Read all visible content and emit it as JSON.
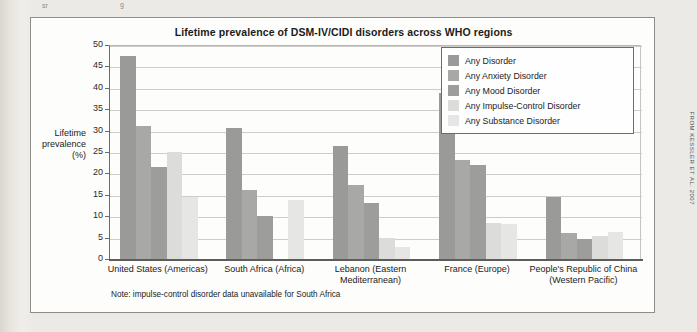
{
  "page": {
    "attribution": "FROM KESSLER ET AL. 2007",
    "top_specks": [
      "sr",
      "g"
    ]
  },
  "chart_data": {
    "type": "bar",
    "title": "Lifetime prevalence of DSM-IV/CIDI disorders across WHO regions",
    "xlabel": "",
    "ylabel": "Lifetime prevalence (%)",
    "ylabel_lines": [
      "Lifetime",
      "prevalence",
      "(%)"
    ],
    "ylim": [
      0,
      50
    ],
    "yticks": [
      0,
      5,
      10,
      15,
      20,
      25,
      30,
      35,
      40,
      45,
      50
    ],
    "ytick_labels": [
      "0",
      "5",
      "10",
      "15",
      "20",
      "25",
      "30",
      "35",
      "40",
      "45",
      "50"
    ],
    "grid": true,
    "legend_position": "top-right",
    "categories": [
      "United States (Americas)",
      "South Africa (Africa)",
      "Lebanon (Eastern Mediterranean)",
      "France (Europe)",
      "People's Republic of China (Western Pacific)"
    ],
    "category_lines": [
      [
        "United States (Americas)"
      ],
      [
        "South Africa (Africa)"
      ],
      [
        "Lebanon (Eastern",
        "Mediterranean)"
      ],
      [
        "France (Europe)"
      ],
      [
        "People's Republic of China",
        "(Western Pacific)"
      ]
    ],
    "series": [
      {
        "name": "Any Disorder",
        "color": "#9a9a99",
        "values": [
          47.4,
          30.5,
          26.3,
          38.7,
          14.4
        ]
      },
      {
        "name": "Any Anxiety Disorder",
        "color": "#a8a8a6",
        "values": [
          31.0,
          16.1,
          17.4,
          23.2,
          6.0
        ]
      },
      {
        "name": "Any Mood Disorder",
        "color": "#9d9d9b",
        "values": [
          21.4,
          10.1,
          13.2,
          21.9,
          4.7
        ]
      },
      {
        "name": "Any Impulse-Control Disorder",
        "color": "#dcdcda",
        "values": [
          25.1,
          null,
          4.9,
          8.5,
          5.4
        ]
      },
      {
        "name": "Any Substance Disorder",
        "color": "#e6e6e4",
        "values": [
          14.6,
          13.7,
          2.9,
          8.2,
          6.2
        ]
      }
    ],
    "note": "Note: impulse-control disorder data unavailable for South Africa"
  }
}
